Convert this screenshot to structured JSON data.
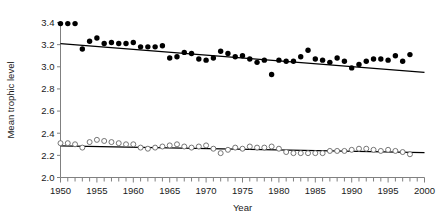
{
  "chart_data": {
    "type": "scatter",
    "title": "",
    "xlabel": "Year",
    "ylabel": "Mean trophic level",
    "xlim": [
      1950,
      2000
    ],
    "ylim": [
      2.0,
      3.4
    ],
    "grid": false,
    "legend_position": "none",
    "x_ticks": [
      1950,
      1955,
      1960,
      1965,
      1970,
      1975,
      1980,
      1985,
      1990,
      1995,
      2000
    ],
    "x_tick_labels": [
      "1950",
      "1955",
      "1960",
      "1965",
      "1970",
      "1975",
      "1980",
      "1985",
      "1990",
      "1995",
      "2000"
    ],
    "x_minor_tick_step": 1,
    "y_ticks": [
      2.0,
      2.2,
      2.4,
      2.6,
      2.8,
      3.0,
      3.2,
      3.4
    ],
    "y_tick_labels": [
      "2.0",
      "2.2",
      "2.4",
      "2.6",
      "2.8",
      "3.0",
      "3.2",
      "3.4"
    ],
    "series": [
      {
        "name": "upper-series",
        "marker": "filled-circle",
        "color": "#000000",
        "x": [
          1950,
          1951,
          1952,
          1953,
          1954,
          1955,
          1956,
          1957,
          1958,
          1959,
          1960,
          1961,
          1962,
          1963,
          1964,
          1965,
          1966,
          1967,
          1968,
          1969,
          1970,
          1971,
          1972,
          1973,
          1974,
          1975,
          1976,
          1977,
          1978,
          1979,
          1980,
          1981,
          1982,
          1983,
          1984,
          1985,
          1986,
          1987,
          1988,
          1989,
          1990,
          1991,
          1992,
          1993,
          1994,
          1995,
          1996,
          1997,
          1998
        ],
        "y": [
          3.39,
          3.39,
          3.39,
          3.16,
          3.23,
          3.26,
          3.21,
          3.22,
          3.21,
          3.21,
          3.22,
          3.18,
          3.18,
          3.18,
          3.19,
          3.08,
          3.09,
          3.13,
          3.12,
          3.07,
          3.06,
          3.08,
          3.14,
          3.12,
          3.09,
          3.1,
          3.07,
          3.04,
          3.06,
          2.93,
          3.06,
          3.05,
          3.05,
          3.09,
          3.15,
          3.07,
          3.06,
          3.04,
          3.08,
          3.05,
          2.99,
          3.02,
          3.05,
          3.07,
          3.07,
          3.06,
          3.1,
          3.05,
          3.11
        ]
      },
      {
        "name": "lower-series",
        "marker": "open-circle",
        "color": "#666666",
        "x": [
          1950,
          1951,
          1952,
          1953,
          1954,
          1955,
          1956,
          1957,
          1958,
          1959,
          1960,
          1961,
          1962,
          1963,
          1964,
          1965,
          1966,
          1967,
          1968,
          1969,
          1970,
          1971,
          1972,
          1973,
          1974,
          1975,
          1976,
          1977,
          1978,
          1979,
          1980,
          1981,
          1982,
          1983,
          1984,
          1985,
          1986,
          1987,
          1988,
          1989,
          1990,
          1991,
          1992,
          1993,
          1994,
          1995,
          1996,
          1997,
          1998
        ],
        "y": [
          2.31,
          2.31,
          2.3,
          2.27,
          2.32,
          2.34,
          2.33,
          2.32,
          2.31,
          2.3,
          2.3,
          2.27,
          2.26,
          2.27,
          2.28,
          2.29,
          2.3,
          2.28,
          2.27,
          2.28,
          2.29,
          2.26,
          2.22,
          2.25,
          2.27,
          2.26,
          2.28,
          2.27,
          2.27,
          2.28,
          2.26,
          2.23,
          2.22,
          2.22,
          2.22,
          2.22,
          2.22,
          2.24,
          2.24,
          2.24,
          2.25,
          2.26,
          2.26,
          2.25,
          2.24,
          2.25,
          2.24,
          2.23,
          2.21
        ]
      }
    ],
    "trendlines": [
      {
        "name": "upper-trendline",
        "x": [
          1950,
          2000
        ],
        "y": [
          3.21,
          2.95
        ],
        "color": "#000000"
      },
      {
        "name": "lower-trendline",
        "x": [
          1950,
          2000
        ],
        "y": [
          2.285,
          2.225
        ],
        "color": "#000000"
      }
    ]
  }
}
